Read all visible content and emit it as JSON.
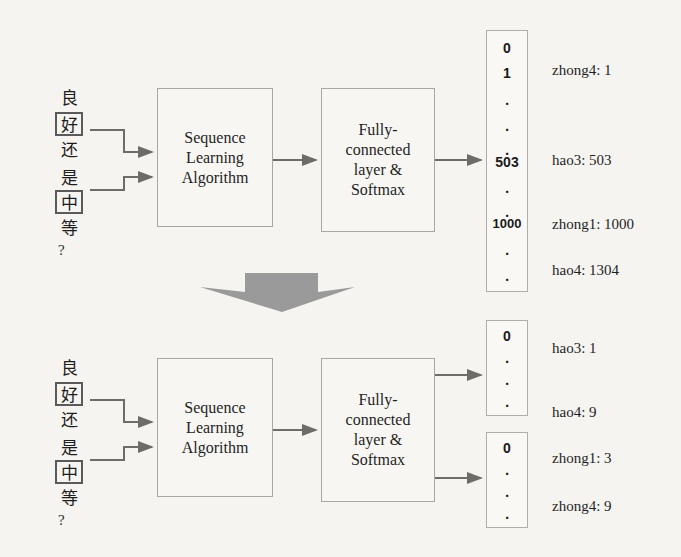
{
  "figure": {
    "background_color": "#f5f4f1",
    "ink_color": "#2b2b2b",
    "box_border_color": "#a9a7a3",
    "wire_color": "#6e6c68",
    "block_arrow_color": "#9a9a9a"
  },
  "input_sentence": {
    "name": "chinese-question",
    "characters": [
      "良",
      "好",
      "还",
      "是",
      "中",
      "等"
    ],
    "boxed_characters": [
      "好",
      "中"
    ],
    "punctuation": "?"
  },
  "top_pipeline": {
    "name": "single-output-pipeline",
    "stage1_label": "Sequence\nLearning\nAlgorithm",
    "stage2_label": "Fully-\nconnected\nlayer &\nSoftmax",
    "vector": {
      "name": "combined-output-vector",
      "cells": [
        "0",
        "1",
        ".",
        ".",
        ".",
        "503",
        ".",
        ".",
        "1000",
        ".",
        "."
      ]
    },
    "annotations": [
      "zhong4: 1",
      "hao3: 503",
      "zhong1: 1000",
      "hao4: 1304"
    ]
  },
  "transition_arrow": {
    "name": "downward-transition-arrow",
    "direction": "down"
  },
  "bottom_pipeline": {
    "name": "dual-output-pipeline",
    "stage1_label": "Sequence\nLearning\nAlgorithm",
    "stage2_label": "Fully-\nconnected\nlayer &\nSoftmax",
    "vector_a": {
      "name": "hao-output-vector",
      "cells": [
        "0",
        ".",
        ".",
        "."
      ]
    },
    "vector_b": {
      "name": "zhong-output-vector",
      "cells": [
        "0",
        ".",
        ".",
        "."
      ]
    },
    "annotations_a": [
      "hao3: 1",
      "hao4: 9"
    ],
    "annotations_b": [
      "zhong1: 3",
      "zhong4: 9"
    ]
  }
}
